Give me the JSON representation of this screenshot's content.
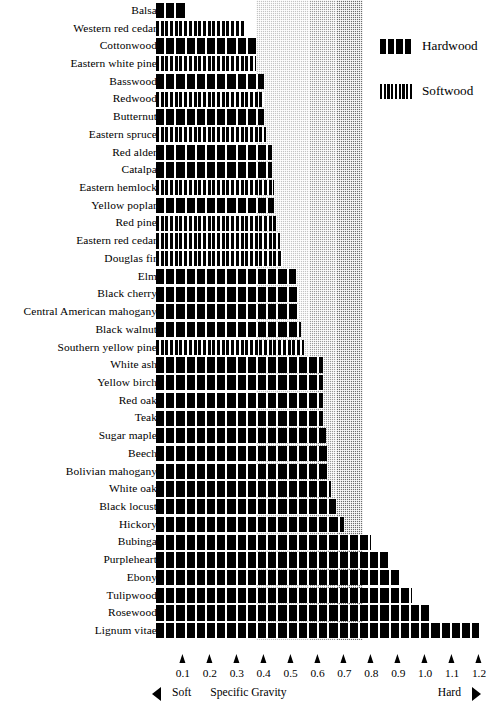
{
  "legend": {
    "items": [
      {
        "label": "Hardwood",
        "swatch": "hardwood-swatch"
      },
      {
        "label": "Softwood",
        "swatch": "softwood-swatch"
      }
    ]
  },
  "axis": {
    "title": "Specific Gravity",
    "left_label": "Soft",
    "right_label": "Hard",
    "left_arrow_icon": "arrow-left-icon",
    "right_arrow_icon": "arrow-right-icon",
    "ticks": [
      "0.1",
      "0.2",
      "0.3",
      "0.4",
      "0.5",
      "0.6",
      "0.7",
      "0.8",
      "0.9",
      "1.0",
      "1.1",
      "1.2"
    ]
  },
  "chart_data": {
    "type": "bar",
    "orientation": "horizontal",
    "title": "",
    "xlabel": "Specific Gravity",
    "ylabel": "",
    "xlim": [
      0,
      1.25
    ],
    "grid": false,
    "legend_position": "top-right",
    "series_key": "wood_type",
    "categories": [
      "Balsa",
      "Western red cedar",
      "Cottonwood",
      "Eastern white pine",
      "Basswood",
      "Redwood",
      "Butternut",
      "Eastern spruce",
      "Red alder",
      "Catalpa",
      "Eastern hemlock",
      "Yellow poplar",
      "Red pine",
      "Eastern red cedar",
      "Douglas fir",
      "Elm",
      "Black cherry",
      "Central American mahogany",
      "Black walnut",
      "Southern yellow pine",
      "White ash",
      "Yellow birch",
      "Red oak",
      "Teak",
      "Sugar maple",
      "Beech",
      "Bolivian mahogany",
      "White oak",
      "Black locust",
      "Hickory",
      "Bubinga",
      "Purpleheart",
      "Ebony",
      "Tulipwood",
      "Rosewood",
      "Lignum vitae"
    ],
    "values": [
      0.11,
      0.33,
      0.37,
      0.37,
      0.4,
      0.4,
      0.4,
      0.41,
      0.43,
      0.43,
      0.44,
      0.44,
      0.45,
      0.46,
      0.47,
      0.52,
      0.53,
      0.53,
      0.54,
      0.55,
      0.62,
      0.62,
      0.62,
      0.62,
      0.63,
      0.64,
      0.64,
      0.65,
      0.67,
      0.7,
      0.8,
      0.86,
      0.91,
      0.95,
      1.02,
      1.2
    ],
    "types": [
      "hardwood",
      "softwood",
      "hardwood",
      "softwood",
      "hardwood",
      "softwood",
      "hardwood",
      "softwood",
      "hardwood",
      "hardwood",
      "softwood",
      "hardwood",
      "softwood",
      "softwood",
      "softwood",
      "hardwood",
      "hardwood",
      "hardwood",
      "hardwood",
      "softwood",
      "hardwood",
      "hardwood",
      "hardwood",
      "hardwood",
      "hardwood",
      "hardwood",
      "hardwood",
      "hardwood",
      "hardwood",
      "hardwood",
      "hardwood",
      "hardwood",
      "hardwood",
      "hardwood",
      "hardwood",
      "hardwood"
    ],
    "shaded_bands": [
      {
        "from": 0.37,
        "to": 0.57,
        "shade": "#c4c4c4"
      },
      {
        "from": 0.57,
        "to": 0.67,
        "shade": "#9a9a9a"
      },
      {
        "from": 0.67,
        "to": 0.77,
        "shade": "#6e6e6e"
      }
    ]
  }
}
